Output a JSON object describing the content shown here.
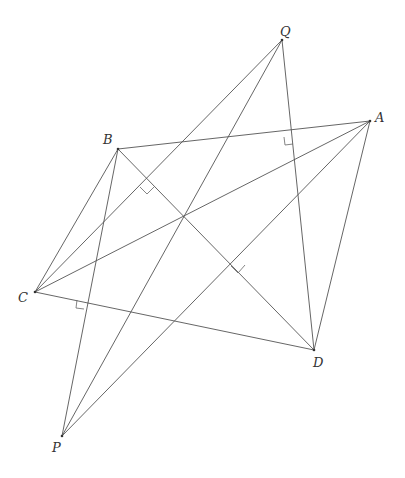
{
  "diagram": {
    "type": "geometry",
    "points": {
      "Q": {
        "x": 282,
        "y": 40,
        "label": "Q",
        "lx": 280,
        "ly": 36
      },
      "A": {
        "x": 370,
        "y": 121,
        "label": "A",
        "lx": 375,
        "ly": 122
      },
      "B": {
        "x": 118,
        "y": 149,
        "label": "B",
        "lx": 103,
        "ly": 144
      },
      "C": {
        "x": 35,
        "y": 292,
        "label": "C",
        "lx": 18,
        "ly": 302
      },
      "D": {
        "x": 314,
        "y": 350,
        "label": "D",
        "lx": 313,
        "ly": 367
      },
      "P": {
        "x": 62,
        "y": 436,
        "label": "P",
        "lx": 52,
        "ly": 452
      }
    },
    "segments": [
      [
        "A",
        "B"
      ],
      [
        "A",
        "C"
      ],
      [
        "A",
        "D"
      ],
      [
        "A",
        "P"
      ],
      [
        "B",
        "C"
      ],
      [
        "B",
        "D"
      ],
      [
        "B",
        "P"
      ],
      [
        "C",
        "D"
      ],
      [
        "C",
        "Q"
      ],
      [
        "Q",
        "P"
      ],
      [
        "Q",
        "D"
      ]
    ],
    "right_angles": [
      {
        "at": "AB∩QD",
        "points": "284,137 285,145 293,144"
      },
      {
        "at": "BD∩CQ",
        "points": "140,187 147,194 154,187"
      },
      {
        "at": "BD∩AP",
        "points": "231,266 238,273 245,265"
      },
      {
        "at": "CD∩BP",
        "points": "77,300 76,308 84,309"
      }
    ]
  }
}
